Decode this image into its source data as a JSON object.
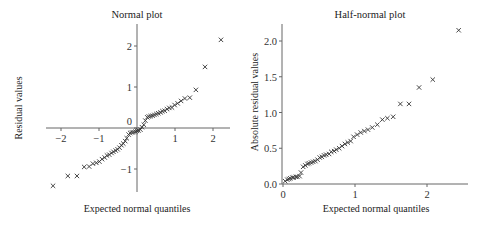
{
  "chart_data": [
    {
      "type": "scatter",
      "title": "Normal plot",
      "xlabel": "Expected normal quantiles",
      "ylabel": "Residual values",
      "marker": "x",
      "xlim": [
        -2.3,
        2.5
      ],
      "ylim": [
        -1.6,
        2.5
      ],
      "xticks": [
        -2,
        -1,
        0,
        1,
        2
      ],
      "yticks": [
        -1,
        0,
        1,
        2
      ],
      "axes_cross_at_origin": true,
      "grid": false,
      "points": [
        [
          -2.21,
          -1.41
        ],
        [
          -1.82,
          -1.17
        ],
        [
          -1.58,
          -1.17
        ],
        [
          -1.39,
          -0.95
        ],
        [
          -1.26,
          -0.94
        ],
        [
          -1.16,
          -0.87
        ],
        [
          -1.07,
          -0.85
        ],
        [
          -0.99,
          -0.82
        ],
        [
          -0.92,
          -0.76
        ],
        [
          -0.85,
          -0.72
        ],
        [
          -0.79,
          -0.67
        ],
        [
          -0.73,
          -0.65
        ],
        [
          -0.67,
          -0.61
        ],
        [
          -0.62,
          -0.58
        ],
        [
          -0.56,
          -0.55
        ],
        [
          -0.51,
          -0.52
        ],
        [
          -0.46,
          -0.48
        ],
        [
          -0.41,
          -0.42
        ],
        [
          -0.36,
          -0.38
        ],
        [
          -0.31,
          -0.32
        ],
        [
          -0.27,
          -0.25
        ],
        [
          -0.22,
          -0.16
        ],
        [
          -0.18,
          -0.12
        ],
        [
          -0.13,
          -0.11
        ],
        [
          -0.09,
          -0.1
        ],
        [
          -0.04,
          -0.09
        ],
        [
          0.0,
          -0.07
        ],
        [
          0.04,
          -0.06
        ],
        [
          0.09,
          -0.04
        ],
        [
          0.13,
          0.02
        ],
        [
          0.18,
          0.08
        ],
        [
          0.22,
          0.18
        ],
        [
          0.27,
          0.26
        ],
        [
          0.31,
          0.28
        ],
        [
          0.36,
          0.29
        ],
        [
          0.41,
          0.3
        ],
        [
          0.46,
          0.32
        ],
        [
          0.51,
          0.34
        ],
        [
          0.56,
          0.36
        ],
        [
          0.62,
          0.38
        ],
        [
          0.67,
          0.41
        ],
        [
          0.73,
          0.42
        ],
        [
          0.79,
          0.46
        ],
        [
          0.85,
          0.49
        ],
        [
          0.92,
          0.5
        ],
        [
          0.99,
          0.56
        ],
        [
          1.07,
          0.6
        ],
        [
          1.16,
          0.66
        ],
        [
          1.26,
          0.72
        ],
        [
          1.39,
          0.74
        ],
        [
          1.55,
          0.93
        ],
        [
          1.79,
          1.49
        ],
        [
          2.21,
          2.15
        ]
      ]
    },
    {
      "type": "scatter",
      "title": "Half-normal plot",
      "xlabel": "Expected normal quantiles",
      "ylabel": "Absolute residual values",
      "marker": "x",
      "xlim": [
        0,
        2.6
      ],
      "ylim": [
        0,
        2.25
      ],
      "xticks": [
        0,
        1,
        2
      ],
      "yticks": [
        0.0,
        0.5,
        1.0,
        1.5,
        2.0
      ],
      "ytick_labels": [
        "0.0",
        "0.5",
        "1.0",
        "1.5",
        "2.0"
      ],
      "grid": false,
      "points": [
        [
          0.03,
          0.04
        ],
        [
          0.06,
          0.06
        ],
        [
          0.08,
          0.07
        ],
        [
          0.1,
          0.08
        ],
        [
          0.13,
          0.09
        ],
        [
          0.15,
          0.09
        ],
        [
          0.18,
          0.1
        ],
        [
          0.2,
          0.1
        ],
        [
          0.23,
          0.11
        ],
        [
          0.25,
          0.16
        ],
        [
          0.28,
          0.24
        ],
        [
          0.31,
          0.26
        ],
        [
          0.34,
          0.28
        ],
        [
          0.36,
          0.29
        ],
        [
          0.39,
          0.3
        ],
        [
          0.42,
          0.31
        ],
        [
          0.45,
          0.32
        ],
        [
          0.48,
          0.34
        ],
        [
          0.51,
          0.37
        ],
        [
          0.54,
          0.38
        ],
        [
          0.57,
          0.4
        ],
        [
          0.6,
          0.41
        ],
        [
          0.64,
          0.42
        ],
        [
          0.67,
          0.45
        ],
        [
          0.71,
          0.46
        ],
        [
          0.74,
          0.48
        ],
        [
          0.78,
          0.5
        ],
        [
          0.82,
          0.53
        ],
        [
          0.86,
          0.56
        ],
        [
          0.9,
          0.58
        ],
        [
          0.94,
          0.6
        ],
        [
          0.98,
          0.66
        ],
        [
          1.03,
          0.69
        ],
        [
          1.08,
          0.72
        ],
        [
          1.13,
          0.74
        ],
        [
          1.18,
          0.76
        ],
        [
          1.24,
          0.79
        ],
        [
          1.31,
          0.83
        ],
        [
          1.38,
          0.9
        ],
        [
          1.45,
          0.92
        ],
        [
          1.53,
          0.94
        ],
        [
          1.63,
          1.12
        ],
        [
          1.75,
          1.12
        ],
        [
          1.89,
          1.35
        ],
        [
          2.08,
          1.46
        ],
        [
          2.44,
          2.15
        ]
      ]
    }
  ]
}
